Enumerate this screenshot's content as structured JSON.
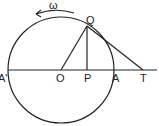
{
  "diagram": {
    "labels": {
      "omega": "ω",
      "Q": "Q",
      "A_prime": "A'",
      "O": "O",
      "P": "P",
      "A": "A",
      "T": "T"
    },
    "colors": {
      "stroke": "#222222",
      "background": "#ffffff"
    }
  }
}
